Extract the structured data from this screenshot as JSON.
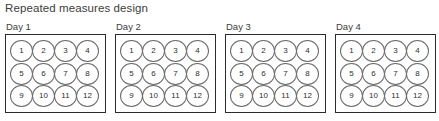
{
  "figure": {
    "title": "Repeated measures design",
    "background_color": "#ffffff",
    "text_color": "#3d3d3d",
    "box_border_color": "#2b2b2b",
    "circle_border_color": "#6b6b6b"
  },
  "panels": [
    {
      "label": "Day 1",
      "rows": [
        [
          "1",
          "2",
          "3",
          "4"
        ],
        [
          "5",
          "6",
          "7",
          "8"
        ],
        [
          "9",
          "10",
          "11",
          "12"
        ]
      ]
    },
    {
      "label": "Day 2",
      "rows": [
        [
          "1",
          "2",
          "3",
          "4"
        ],
        [
          "5",
          "6",
          "7",
          "8"
        ],
        [
          "9",
          "10",
          "11",
          "12"
        ]
      ]
    },
    {
      "label": "Day 3",
      "rows": [
        [
          "1",
          "2",
          "3",
          "4"
        ],
        [
          "5",
          "6",
          "7",
          "8"
        ],
        [
          "9",
          "10",
          "11",
          "12"
        ]
      ]
    },
    {
      "label": "Day 4",
      "rows": [
        [
          "1",
          "2",
          "3",
          "4"
        ],
        [
          "5",
          "6",
          "7",
          "8"
        ],
        [
          "9",
          "10",
          "11",
          "12"
        ]
      ]
    }
  ]
}
